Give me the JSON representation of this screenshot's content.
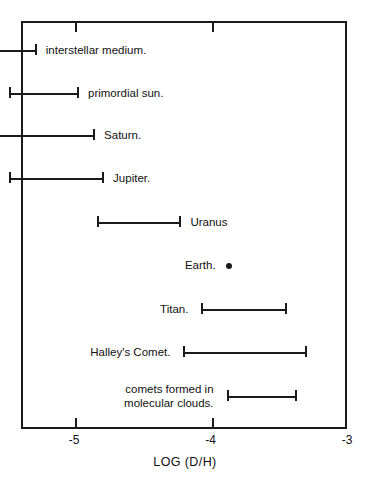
{
  "chart_data": {
    "type": "bar",
    "orientation": "horizontal",
    "title": "",
    "xlabel": "LOG (D/H)",
    "ylabel": "",
    "xlim": [
      -5.5,
      -3.0
    ],
    "xticks": [
      -5,
      -4,
      -3
    ],
    "xtick_labels": [
      "-5",
      "-4",
      "-3"
    ],
    "grid": false,
    "legend": null,
    "note": "Horizontal range (error-bar) chart of deuterium-to-hydrogen ratio for solar system and interstellar reservoirs.",
    "items": [
      {
        "label": "interstellar medium.",
        "label_side": "right",
        "kind": "range",
        "low": -5.794,
        "high": -5.287
      },
      {
        "label": "primordial sun.",
        "label_side": "right",
        "kind": "range",
        "low": -5.493,
        "high": -4.978
      },
      {
        "label": "Saturn.",
        "label_side": "right",
        "kind": "range",
        "low": -5.721,
        "high": -4.86
      },
      {
        "label": "Jupiter.",
        "label_side": "right",
        "kind": "range",
        "low": -5.493,
        "high": -4.794
      },
      {
        "label": "Uranus",
        "label_side": "right",
        "kind": "range",
        "low": -4.846,
        "high": -4.228
      },
      {
        "label": "Earth.",
        "label_side": "left",
        "kind": "point",
        "value": -3.882
      },
      {
        "label": "Titan.",
        "label_side": "left",
        "kind": "range",
        "low": -4.081,
        "high": -3.456
      },
      {
        "label": "Halley's Comet.",
        "label_side": "left",
        "kind": "range",
        "low": -4.213,
        "high": -3.309
      },
      {
        "label": "comets formed in\nmolecular clouds.",
        "label_side": "left",
        "kind": "range",
        "low": -3.897,
        "high": -3.382
      }
    ]
  },
  "axis": {
    "title": "LOG (D/H)",
    "tick_labels": [
      "-5",
      "-4",
      "-3"
    ]
  }
}
